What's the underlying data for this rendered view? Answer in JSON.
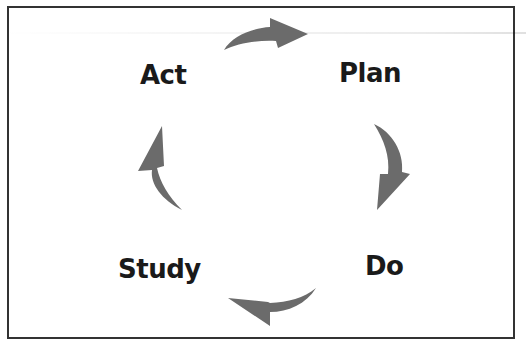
{
  "diagram": {
    "type": "cycle",
    "stages": [
      {
        "id": "plan",
        "label": "Plan"
      },
      {
        "id": "do",
        "label": "Do"
      },
      {
        "id": "study",
        "label": "Study"
      },
      {
        "id": "act",
        "label": "Act"
      }
    ],
    "edges": [
      {
        "from": "act",
        "to": "plan"
      },
      {
        "from": "plan",
        "to": "do"
      },
      {
        "from": "do",
        "to": "study"
      },
      {
        "from": "study",
        "to": "act"
      }
    ],
    "direction": "clockwise"
  },
  "colors": {
    "arrow": "#6b6b6b",
    "text": "#1a1a1a",
    "border": "#333333",
    "background": "#ffffff"
  }
}
